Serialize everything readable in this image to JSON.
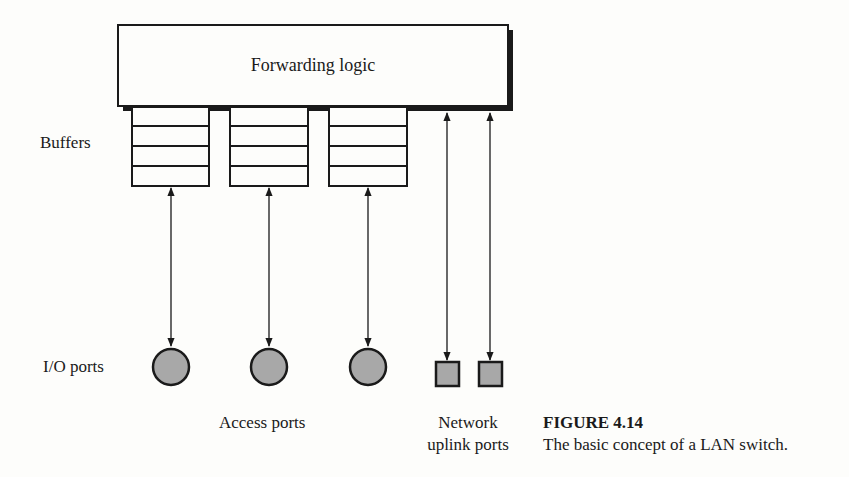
{
  "figure": {
    "forwarding_box": {
      "label": "Forwarding logic"
    },
    "buffers_label": "Buffers",
    "io_ports_label": "I/O ports",
    "access_ports_label": "Access ports",
    "uplink_label_line1": "Network",
    "uplink_label_line2": "uplink ports",
    "buffers": [
      {
        "id": "buffer-1",
        "cells": 4
      },
      {
        "id": "buffer-2",
        "cells": 4
      },
      {
        "id": "buffer-3",
        "cells": 4
      }
    ],
    "access_ports": [
      {
        "id": "access-port-1",
        "shape": "circle"
      },
      {
        "id": "access-port-2",
        "shape": "circle"
      },
      {
        "id": "access-port-3",
        "shape": "circle"
      }
    ],
    "uplink_ports": [
      {
        "id": "uplink-port-1",
        "shape": "square"
      },
      {
        "id": "uplink-port-2",
        "shape": "square"
      }
    ],
    "colors": {
      "stroke": "#1a1a1a",
      "port_fill": "#a8a8a8",
      "background": "#fdfdfb"
    }
  },
  "caption": {
    "title": "FIGURE 4.14",
    "text": "The basic concept of a LAN switch."
  }
}
